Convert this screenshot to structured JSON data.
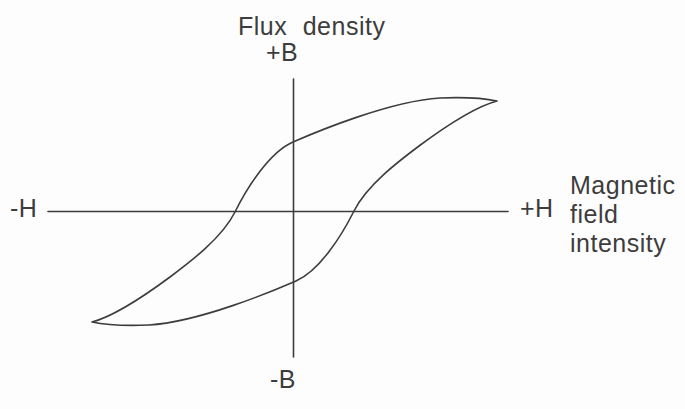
{
  "colors": {
    "ink": "#3d3d3d",
    "bg": "#fdfdfd"
  },
  "figure": {
    "type": "hysteresis-loop-diagram",
    "labels": {
      "y_axis_title": "Flux density",
      "y_positive": "+B",
      "y_negative": "-B",
      "x_negative": "-H",
      "x_positive": "+H",
      "x_axis_title": "Magnetic field intensity",
      "x_axis_title_lines": [
        "Magnetic",
        "field",
        "intensity"
      ]
    },
    "curve": {
      "name": "hysteresis-loop",
      "path": "M 92 322 C 115 316 143 297 170 277 C 190 262 222 238 235 212 C 248 186 270 152 293 142 C 316 132 390 101 440 98 C 465 97 483 98 497 101 C 474 107 446 126 419 146 C 399 161 367 185 354 211 C 341 237 319 271 296 281 C 273 291 199 322 149 325 C 124 326 106 325 92 322 Z"
    }
  }
}
